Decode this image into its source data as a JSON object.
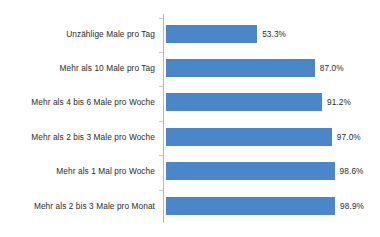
{
  "chart_data": {
    "type": "bar",
    "orientation": "horizontal",
    "title": "",
    "subtitle": "",
    "xlabel": "",
    "ylabel": "",
    "xlim": [
      0,
      100
    ],
    "grid": false,
    "legend": null,
    "value_suffix": "%",
    "categories": [
      "Unzählige Male pro Tag",
      "Mehr als 10 Male pro Tag",
      "Mehr als 4 bis 6 Male pro Woche",
      "Mehr als 2 bis 3 Male pro Woche",
      "Mehr als 1 Mal pro Woche",
      "Mehr als 2 bis 3 Male pro Monat"
    ],
    "values": [
      53.3,
      87.0,
      91.2,
      97.0,
      98.6,
      98.9
    ],
    "value_labels": [
      "53.3%",
      "87.0%",
      "91.2%",
      "97.0%",
      "98.6%",
      "98.9%"
    ],
    "colors": {
      "bar": "#4a86c8",
      "axis_line": "#b6b6b6",
      "tick": "#c8c8c8",
      "text": "#2b2b2b",
      "background": "#ffffff"
    }
  }
}
